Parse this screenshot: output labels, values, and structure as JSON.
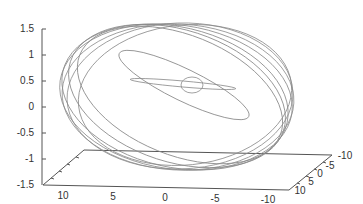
{
  "chart_data": {
    "type": "line",
    "subtype": "3d-parametric",
    "title": "",
    "xlabel": "",
    "ylabel": "",
    "zlabel": "",
    "x_ticks": [
      "10",
      "5",
      "0",
      "-5",
      "-10"
    ],
    "y_ticks": [
      "10",
      "5",
      "0",
      "-5",
      "-10"
    ],
    "z_ticks": [
      "1.5",
      "1",
      "0.5",
      "0",
      "-0.5",
      "-1",
      "-1.5"
    ],
    "xlim": [
      10,
      -10
    ],
    "ylim": [
      10,
      -10
    ],
    "zlim": [
      -1.5,
      1.5
    ],
    "grid": false,
    "legend": false,
    "line_color": "#8a8a8a",
    "loops": [
      {
        "cx": 192,
        "cy": 85,
        "rx": 11,
        "ry": 8,
        "rot": 0
      },
      {
        "cx": 183,
        "cy": 84,
        "rx": 53,
        "ry": 3,
        "rot": 5
      },
      {
        "cx": 184,
        "cy": 85,
        "rx": 72,
        "ry": 16,
        "rot": 26
      },
      {
        "cx": 180,
        "cy": 95,
        "rx": 108,
        "ry": 60,
        "rot": 22
      },
      {
        "cx": 177,
        "cy": 96,
        "rx": 112,
        "ry": 66,
        "rot": 18
      },
      {
        "cx": 175,
        "cy": 97,
        "rx": 115,
        "ry": 70,
        "rot": 13
      },
      {
        "cx": 176,
        "cy": 97,
        "rx": 117,
        "ry": 72,
        "rot": 8
      },
      {
        "cx": 178,
        "cy": 97,
        "rx": 116,
        "ry": 73,
        "rot": 3
      },
      {
        "cx": 180,
        "cy": 96,
        "rx": 113,
        "ry": 73,
        "rot": -2
      },
      {
        "cx": 185,
        "cy": 95,
        "rx": 107,
        "ry": 70,
        "rot": -6
      }
    ]
  }
}
